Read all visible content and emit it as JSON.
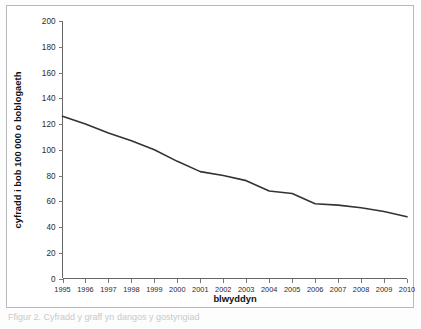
{
  "figure": {
    "caption": "Ffigur 2. Cyfradd  y  graff  yn  dangos  y  gostyngiad",
    "background_color": "#ffffff",
    "frame_color": "#b9b9b9"
  },
  "chart_data": {
    "type": "line",
    "title": "",
    "xlabel": "blwyddyn",
    "ylabel": "cyfradd i bob 100 000 o boblogaeth",
    "x": [
      1995,
      1996,
      1997,
      1998,
      1999,
      2000,
      2001,
      2002,
      2003,
      2004,
      2005,
      2006,
      2007,
      2008,
      2009,
      2010
    ],
    "categories": [
      "1995",
      "1996",
      "1997",
      "1998",
      "1999",
      "2000",
      "2001",
      "2002",
      "2003",
      "2004",
      "2005",
      "2006",
      "2007",
      "2008",
      "2009",
      "2010"
    ],
    "values": [
      126,
      120,
      113,
      107,
      100,
      91,
      83,
      80,
      76,
      68,
      66,
      58,
      57,
      55,
      52,
      48
    ],
    "series": [
      {
        "name": "cyfradd",
        "color": "#333333",
        "values": [
          126,
          120,
          113,
          107,
          100,
          91,
          83,
          80,
          76,
          68,
          66,
          58,
          57,
          55,
          52,
          48
        ]
      }
    ],
    "ylim": [
      0,
      200
    ],
    "ytick_step": 20,
    "yticks": [
      0,
      20,
      40,
      60,
      80,
      100,
      120,
      140,
      160,
      180,
      200
    ],
    "ytick_labels": [
      "0",
      "20",
      "40",
      "60",
      "80",
      "100",
      "120",
      "140",
      "160",
      "180",
      "200"
    ],
    "xlim": [
      1995,
      2010
    ],
    "xticks": [
      1995,
      1996,
      1997,
      1998,
      1999,
      2000,
      2001,
      2002,
      2003,
      2004,
      2005,
      2006,
      2007,
      2008,
      2009,
      2010
    ],
    "grid": false,
    "legend": false,
    "legend_position": "none",
    "markers": false,
    "line_color": "#333333",
    "axis_color": "#666666"
  }
}
